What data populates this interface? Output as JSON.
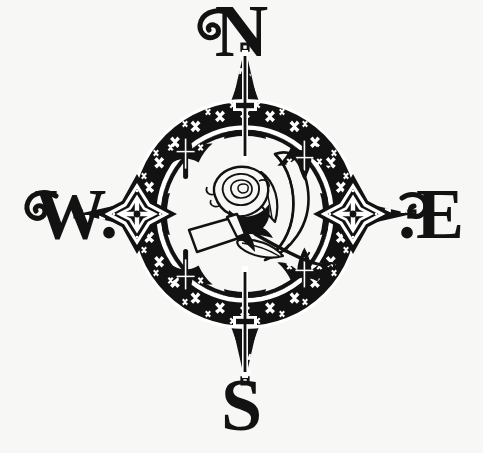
{
  "image": {
    "title": "Compass Rose with Rose and Crescent Moon",
    "background_color": "#f7f7f5",
    "ink_color": "#121212",
    "highlight_color": "#ffffff",
    "width": 483,
    "height": 453
  },
  "compass": {
    "center_x": 245,
    "center_y": 214,
    "outer_ring_radius": 112,
    "inner_ring_radius": 86,
    "star_point_count": 8,
    "diagonal_point_tip_radius": 158,
    "cardinal_point_tip_radius": 140
  },
  "cardinals": {
    "north": {
      "label": "N",
      "name": "north-label"
    },
    "south": {
      "label": "S",
      "name": "south-label"
    },
    "west": {
      "label": "W.",
      "name": "west-label"
    },
    "east": {
      "label": ".E",
      "name": "east-label"
    }
  },
  "ornaments": {
    "ring_motif": "cross-stitch-x",
    "cardinal_medallion_east_west": "four-point-diamond-star",
    "cardinal_needle_north_south": "spear-needle",
    "diagonal_point_fill": "graduated-white-squares",
    "diagonal_tip_marker": "square-dot",
    "inner_corner_motif": "fleur-de-lis"
  },
  "center_emblem": {
    "rose": "line-art-rose-bloom",
    "moon": "crescent-moon-outline",
    "leaf": "rose-leaf",
    "stem": "curving-thorned-stem",
    "banner": "blank-white-ribbon-banner"
  }
}
